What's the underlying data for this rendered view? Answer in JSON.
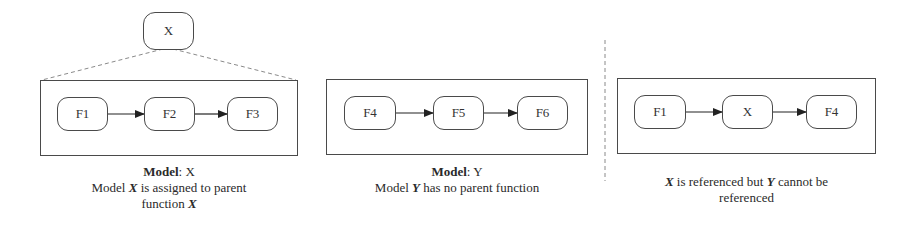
{
  "top_parent": {
    "label": "X"
  },
  "panels": [
    {
      "id": "model-x",
      "nodes": [
        "F1",
        "F2",
        "F3"
      ],
      "caption": {
        "title_bold": "Model",
        "title_rest": ": X",
        "line2_pre": "Model ",
        "line2_var": "X",
        "line2_post": " is assigned to parent",
        "line3_pre": "function ",
        "line3_var": "X"
      }
    },
    {
      "id": "model-y",
      "nodes": [
        "F4",
        "F5",
        "F6"
      ],
      "caption": {
        "title_bold": "Model",
        "title_rest": ": Y",
        "line2_pre": "Model ",
        "line2_var": "Y",
        "line2_post": " has no parent function"
      }
    },
    {
      "id": "reference",
      "nodes": [
        "F1",
        "X",
        "F4"
      ],
      "caption": {
        "line1_var1": "X",
        "line1_mid": " is referenced but ",
        "line1_var2": "Y",
        "line1_post": " cannot be",
        "line2": "referenced"
      }
    }
  ],
  "colors": {
    "stroke": "#4a4a4a",
    "dashed": "#8a8a8a",
    "text": "#2a2a2a",
    "background": "#ffffff"
  }
}
